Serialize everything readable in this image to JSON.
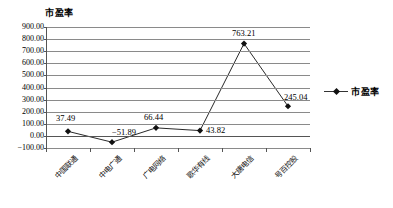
{
  "chart_data": {
    "type": "line",
    "title": "市盈率",
    "xlabel": "",
    "ylabel": "",
    "categories": [
      "中国联通",
      "中电广通",
      "广电网络",
      "歌华有线",
      "大唐电信",
      "号百控股"
    ],
    "series": [
      {
        "name": "市盈率",
        "values": [
          37.49,
          -51.89,
          66.44,
          43.82,
          763.21,
          245.04
        ],
        "labels": [
          "37.49",
          "-51.89",
          "66.44",
          "43.82",
          "763.21",
          "245.04"
        ],
        "marker": "diamond",
        "color": "#111111"
      }
    ],
    "ylim": [
      -100,
      900
    ],
    "ytick_step": 100,
    "ytick_labels": [
      "900.00",
      "800.00",
      "700.00",
      "600.00",
      "500.00",
      "400.00",
      "300.00",
      "200.00",
      "100.00",
      "0.00",
      "-100.00"
    ],
    "grid": true,
    "grid_axis": "y",
    "legend_position": "right",
    "legend_entries": [
      "市盈率"
    ]
  },
  "legend": {
    "label": "市盈率",
    "marker_icon": "diamond-marker-icon"
  },
  "title": {
    "text": "市盈率"
  }
}
